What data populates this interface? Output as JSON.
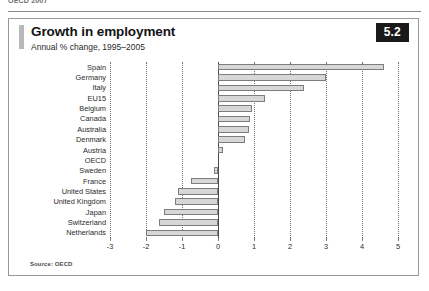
{
  "page": {
    "top_text": "OECD 2007"
  },
  "figure": {
    "title": "Growth in employment",
    "subtitle": "Annual % change, 1995–2005",
    "badge": "5.2",
    "source": "Source: OECD"
  },
  "chart_data": {
    "type": "bar",
    "orientation": "horizontal",
    "title": "Growth in employment",
    "subtitle": "Annual % change, 1995–2005",
    "xlabel": "",
    "ylabel": "",
    "xlim": [
      -3,
      5
    ],
    "xticks": [
      -3,
      -2,
      -1,
      0,
      1,
      2,
      3,
      4,
      5
    ],
    "xtick_labels": [
      "-3",
      "-2",
      "-1",
      "0",
      "1",
      "2",
      "3",
      "4",
      "5"
    ],
    "grid": true,
    "grid_style": "dotted vertical",
    "legend": "none",
    "bar_fill": "#d7d7d7",
    "bar_edge": "#7d7d7d",
    "categories": [
      "Spain",
      "Germany",
      "Italy",
      "EU15",
      "Belgium",
      "Canada",
      "Australia",
      "Denmark",
      "Austria",
      "OECD",
      "Sweden",
      "France",
      "United States",
      "United Kingdom",
      "Japan",
      "Switzerland",
      "Netherlands"
    ],
    "values": [
      4.6,
      3.0,
      2.4,
      1.3,
      0.95,
      0.9,
      0.85,
      0.75,
      0.15,
      0.0,
      -0.1,
      -0.75,
      -1.1,
      -1.2,
      -1.5,
      -1.65,
      -2.0
    ],
    "series": [
      {
        "name": "Annual % change, 1995–2005",
        "values": [
          4.6,
          3.0,
          2.4,
          1.3,
          0.95,
          0.9,
          0.85,
          0.75,
          0.15,
          0.0,
          -0.1,
          -0.75,
          -1.1,
          -1.2,
          -1.5,
          -1.65,
          -2.0
        ]
      }
    ],
    "source": "Source: OECD"
  }
}
